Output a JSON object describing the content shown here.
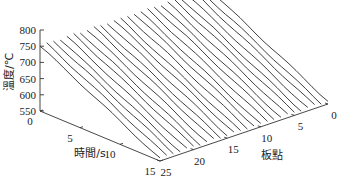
{
  "chart_data": {
    "type": "line",
    "subtype": "3d-waterfall",
    "title": "",
    "zlabel": "溫度/℃",
    "xlabel": "時間/s",
    "ylabel": "板點",
    "zlim": [
      550,
      800
    ],
    "xlim": [
      0,
      15
    ],
    "ylim": [
      0,
      25
    ],
    "z_ticks": [
      "800",
      "750",
      "700",
      "650",
      "600",
      "550"
    ],
    "x_ticks": [
      "0",
      "5",
      "10",
      "15"
    ],
    "y_ticks": [
      "0",
      "5",
      "10",
      "15",
      "20",
      "25"
    ],
    "grid": false,
    "legend": null,
    "series_count": 26,
    "time_points": [
      0,
      1,
      2,
      3,
      4,
      5,
      6,
      7,
      8,
      9,
      10,
      11,
      12,
      13,
      14,
      15
    ],
    "series_description": "Each plate point (0-25) has one temperature curve over time, starting near 745-755 ℃ at t=0 and falling roughly linearly to about 555 ℃ at t=15 s",
    "representative_series": {
      "name": "plate point (typical)",
      "values": [
        750,
        738,
        725,
        712,
        700,
        687,
        674,
        661,
        648,
        635,
        622,
        609,
        596,
        583,
        570,
        558
      ]
    }
  }
}
